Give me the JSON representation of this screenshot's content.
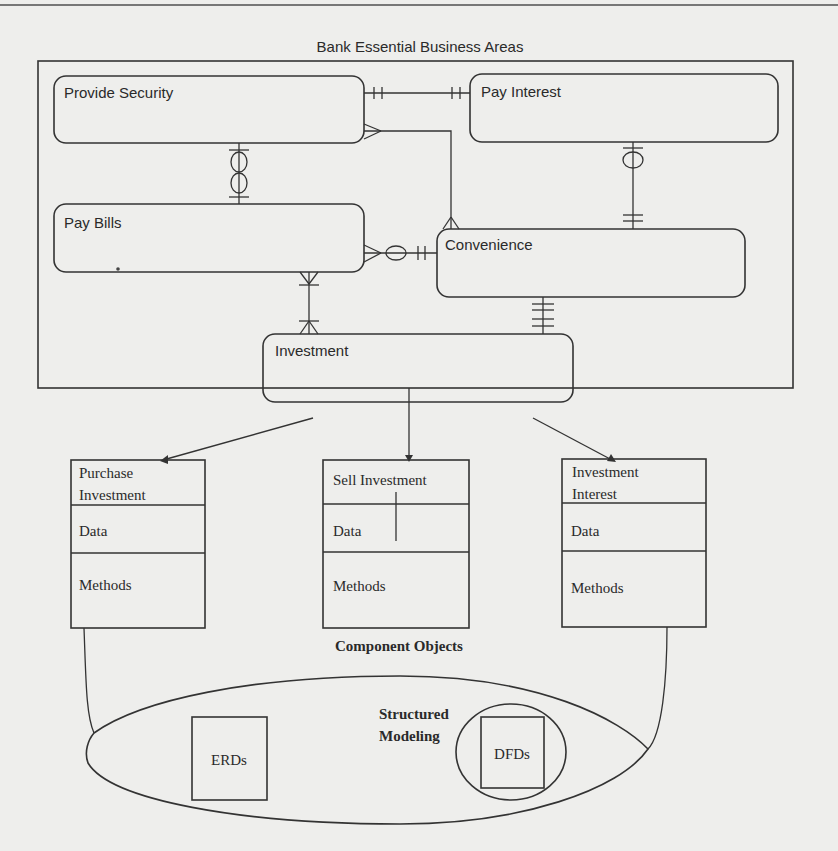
{
  "diagram": {
    "title": "Bank Essential Business Areas",
    "entities": [
      {
        "id": "provide-security",
        "label": "Provide Security"
      },
      {
        "id": "pay-interest",
        "label": "Pay Interest"
      },
      {
        "id": "pay-bills",
        "label": "Pay Bills"
      },
      {
        "id": "convenience",
        "label": "Convenience"
      },
      {
        "id": "investment",
        "label": "Investment"
      }
    ],
    "relationships": [
      {
        "from": "Provide Security",
        "to": "Pay Interest",
        "from_end": "one-and-only-one",
        "to_end": "one-and-only-one"
      },
      {
        "from": "Provide Security",
        "to": "Convenience",
        "from_end": "many",
        "to_end": "many"
      },
      {
        "from": "Provide Security",
        "to": "Pay Bills",
        "from_end": "zero-or-one",
        "to_end": "zero-or-one"
      },
      {
        "from": "Pay Interest",
        "to": "Convenience",
        "from_end": "zero-or-one",
        "to_end": "one-and-only-one"
      },
      {
        "from": "Pay Bills",
        "to": "Convenience",
        "from_end": "many",
        "to_end": "zero-or-one (one)"
      },
      {
        "from": "Pay Bills",
        "to": "Investment",
        "from_end": "one-or-many",
        "to_end": "one-or-many"
      },
      {
        "from": "Convenience",
        "to": "Investment",
        "from_end": "one-and-only-one",
        "to_end": "one-and-only-one"
      }
    ],
    "component_objects": {
      "label": "Component Objects",
      "objects": [
        {
          "name_line1": "Purchase",
          "name_line2": "Investment",
          "data_label": "Data",
          "methods_label": "Methods"
        },
        {
          "name_line1": "Sell Investment",
          "name_line2": "",
          "data_label": "Data",
          "methods_label": "Methods"
        },
        {
          "name_line1": "Investment",
          "name_line2": "Interest",
          "data_label": "Data",
          "methods_label": "Methods"
        }
      ]
    },
    "structured_modeling": {
      "label_line1": "Structured",
      "label_line2": "Modeling",
      "items": [
        "ERDs",
        "DFDs"
      ]
    }
  }
}
